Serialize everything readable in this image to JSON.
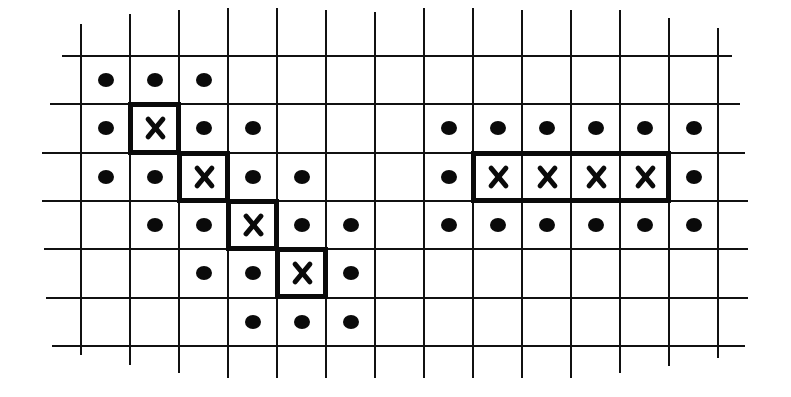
{
  "diagram": {
    "grid": {
      "origin_x": 81,
      "origin_y": 56,
      "cell_w": 49,
      "cell_h": 48.3,
      "columns": 14,
      "rows": 6,
      "line_color": "#111111"
    },
    "figures": [
      {
        "name": "diagonal-figure",
        "x_cells": [
          [
            1,
            1
          ],
          [
            2,
            2
          ],
          [
            3,
            3
          ],
          [
            4,
            4
          ]
        ],
        "dot_cells": [
          [
            0,
            0
          ],
          [
            1,
            0
          ],
          [
            2,
            0
          ],
          [
            0,
            1
          ],
          [
            2,
            1
          ],
          [
            3,
            1
          ],
          [
            0,
            2
          ],
          [
            1,
            2
          ],
          [
            3,
            2
          ],
          [
            4,
            2
          ],
          [
            1,
            3
          ],
          [
            2,
            3
          ],
          [
            4,
            3
          ],
          [
            5,
            3
          ],
          [
            2,
            4
          ],
          [
            3,
            4
          ],
          [
            5,
            4
          ],
          [
            3,
            5
          ],
          [
            4,
            5
          ],
          [
            5,
            5
          ]
        ]
      },
      {
        "name": "horizontal-figure",
        "x_cells": [
          [
            8,
            2
          ],
          [
            9,
            2
          ],
          [
            10,
            2
          ],
          [
            11,
            2
          ]
        ],
        "dot_cells": [
          [
            7,
            1
          ],
          [
            8,
            1
          ],
          [
            9,
            1
          ],
          [
            10,
            1
          ],
          [
            11,
            1
          ],
          [
            12,
            1
          ],
          [
            7,
            2
          ],
          [
            12,
            2
          ],
          [
            7,
            3
          ],
          [
            8,
            3
          ],
          [
            9,
            3
          ],
          [
            10,
            3
          ],
          [
            11,
            3
          ],
          [
            12,
            3
          ]
        ]
      }
    ],
    "colors": {
      "ink": "#0a0a0a",
      "paper": "#ffffff"
    }
  }
}
